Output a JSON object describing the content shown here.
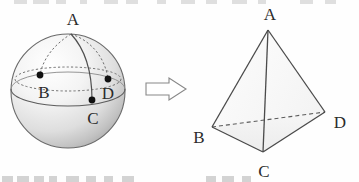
{
  "figure": {
    "arrow_label": "transforms-to",
    "stroke_color": "#4a4a4a",
    "label_color": "#2b2b2b",
    "dot_color": "#111111",
    "sphere_fill_light": "#fdfdfd",
    "sphere_fill_shade": "#b8b8b8",
    "tetra_fill": "#fbfbfb"
  },
  "sphere": {
    "name": "sphere-diagram",
    "center": {
      "x": 68,
      "y": 91
    },
    "radius": 58,
    "points": [
      {
        "id": "A",
        "label": "A",
        "label_x": 73,
        "label_y": 25,
        "dot": false,
        "dot_x": 71,
        "dot_y": 33
      },
      {
        "id": "B",
        "label": "B",
        "label_x": 44,
        "label_y": 98,
        "dot": true,
        "dot_x": 40,
        "dot_y": 75
      },
      {
        "id": "D",
        "label": "D",
        "label_x": 108,
        "label_y": 99,
        "dot": true,
        "dot_x": 108,
        "dot_y": 79
      },
      {
        "id": "C",
        "label": "C",
        "label_x": 93,
        "label_y": 123,
        "dot": true,
        "dot_x": 92,
        "dot_y": 100
      }
    ],
    "arcs": [
      {
        "id": "arc-A-B",
        "style": "dashed"
      },
      {
        "id": "arc-A-D",
        "style": "dashed"
      },
      {
        "id": "arc-A-C",
        "style": "solid"
      },
      {
        "id": "latitude-through-B-D",
        "style": "dashed"
      },
      {
        "id": "equator-through-C",
        "style": "solid"
      }
    ]
  },
  "arrow": {
    "name": "transformation-arrow",
    "direction": "right",
    "x": 145,
    "y": 78,
    "width": 42,
    "height": 22
  },
  "tetrahedron": {
    "name": "tetrahedron-diagram",
    "vertices": [
      {
        "id": "A",
        "label": "A",
        "x": 268,
        "y": 30,
        "label_x": 270,
        "label_y": 20
      },
      {
        "id": "B",
        "label": "B",
        "x": 212,
        "y": 127,
        "label_x": 199,
        "label_y": 142
      },
      {
        "id": "C",
        "label": "C",
        "x": 263,
        "y": 152,
        "label_x": 264,
        "label_y": 176
      },
      {
        "id": "D",
        "label": "D",
        "x": 325,
        "y": 112,
        "label_x": 340,
        "label_y": 127
      }
    ],
    "edges": [
      {
        "id": "edge-A-B",
        "from": "A",
        "to": "B",
        "style": "solid"
      },
      {
        "id": "edge-A-C",
        "from": "A",
        "to": "C",
        "style": "solid"
      },
      {
        "id": "edge-A-D",
        "from": "A",
        "to": "D",
        "style": "solid"
      },
      {
        "id": "edge-B-C",
        "from": "B",
        "to": "C",
        "style": "solid"
      },
      {
        "id": "edge-C-D",
        "from": "C",
        "to": "D",
        "style": "solid"
      },
      {
        "id": "edge-B-D",
        "from": "B",
        "to": "D",
        "style": "dashed"
      }
    ]
  },
  "cropped_text": {
    "top_row": "",
    "bottom_row": ""
  }
}
